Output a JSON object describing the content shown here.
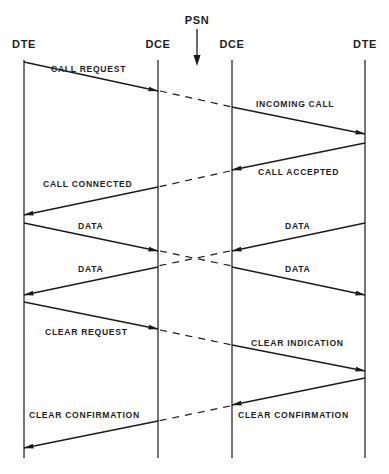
{
  "title_marker": "PSN",
  "entities": [
    {
      "id": "dte_left",
      "label": "DTE",
      "x": 24
    },
    {
      "id": "dce_left",
      "label": "DCE",
      "x": 158
    },
    {
      "id": "dce_right",
      "label": "DCE",
      "x": 232
    },
    {
      "id": "dte_right",
      "label": "DTE",
      "x": 365
    }
  ],
  "messages": [
    {
      "label": "CALL REQUEST",
      "from": "DTE (left)",
      "to": "DCE (left)"
    },
    {
      "label": "INCOMING CALL",
      "from": "DCE (right)",
      "to": "DTE (right)"
    },
    {
      "label": "CALL ACCEPTED",
      "from": "DTE (right)",
      "to": "DCE (right)"
    },
    {
      "label": "CALL CONNECTED",
      "from": "DCE (left)",
      "to": "DTE (left)"
    },
    {
      "label": "DATA",
      "from": "DTE (left)",
      "to": "DCE (left)"
    },
    {
      "label": "DATA",
      "from": "DTE (right)",
      "to": "DCE (right)"
    },
    {
      "label": "DATA",
      "from": "DCE (left)",
      "to": "DTE (left)"
    },
    {
      "label": "DATA",
      "from": "DCE (right)",
      "to": "DTE (right)"
    },
    {
      "label": "CLEAR REQUEST",
      "from": "DTE (left)",
      "to": "DCE (left)"
    },
    {
      "label": "CLEAR INDICATION",
      "from": "DCE (right)",
      "to": "DTE (right)"
    },
    {
      "label": "CLEAR CONFIRMATION",
      "from": "DTE (right)",
      "to": "DCE (right)"
    },
    {
      "label": "CLEAR CONFIRMATION",
      "from": "DCE (left)",
      "to": "DTE (left)"
    }
  ]
}
